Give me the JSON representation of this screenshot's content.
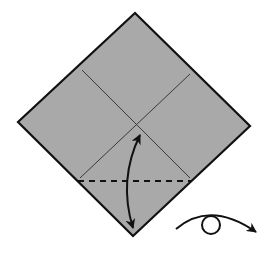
{
  "diagram": {
    "colors": {
      "background": "#ffffff",
      "paper": "#a9a9a9",
      "edge": "#111111",
      "crease": "#3a3a3a",
      "arrow": "#111111"
    },
    "paper": {
      "shape": "square-diamond",
      "vertices": {
        "top": [
          135,
          13
        ],
        "right": [
          250,
          126
        ],
        "bottom": [
          133,
          236
        ],
        "left": [
          18,
          122
        ]
      }
    },
    "creases": [
      {
        "name": "diagonal-crease-a",
        "from": [
          82,
          70
        ],
        "to": [
          190,
          178
        ]
      },
      {
        "name": "diagonal-crease-b",
        "from": [
          190,
          74
        ],
        "to": [
          80,
          178
        ]
      }
    ],
    "fold_lines": [
      {
        "name": "valley-fold-line",
        "type": "dashed",
        "from": [
          78,
          181
        ],
        "to": [
          192,
          181
        ]
      }
    ],
    "symbols": [
      {
        "name": "fold-and-unfold-arrow",
        "meaning": "fold and unfold",
        "from": [
          133,
          230
        ],
        "to": [
          140,
          133
        ]
      },
      {
        "name": "turn-over-symbol",
        "meaning": "turn model over",
        "center": [
          212,
          225
        ]
      }
    ]
  }
}
